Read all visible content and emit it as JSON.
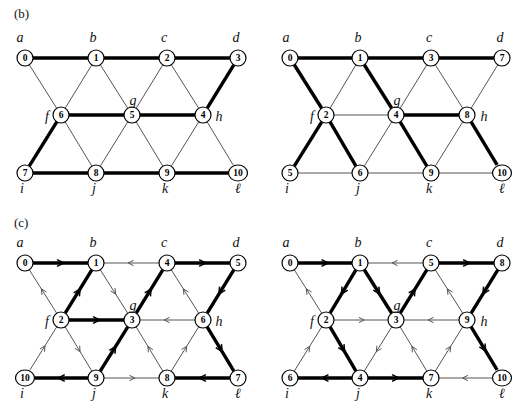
{
  "figure": {
    "title_parts": [
      "(b)",
      "(c)"
    ],
    "corner_letters": [
      "a",
      "b",
      "c",
      "d",
      "f",
      "g",
      "h",
      "i",
      "j",
      "k",
      "ℓ"
    ],
    "background": "#ffffff",
    "thick_color": "#000000",
    "thin_color": "#555555",
    "node_fill": "#ffffff"
  },
  "panels": [
    {
      "id": "b-left",
      "tag": "(b)",
      "tag_pos": [
        14,
        18
      ],
      "origin": [
        25,
        58
      ],
      "show_tag": true,
      "directed": false,
      "node_labels": [
        "0",
        "1",
        "2",
        "3",
        "4",
        "5",
        "6",
        "7",
        "8",
        "9",
        "10"
      ],
      "nodes": [
        {
          "label": "0",
          "x": 25,
          "y": 58
        },
        {
          "label": "1",
          "x": 96,
          "y": 58
        },
        {
          "label": "2",
          "x": 167,
          "y": 58
        },
        {
          "label": "3",
          "x": 238,
          "y": 58
        },
        {
          "label": "6",
          "x": 61,
          "y": 115
        },
        {
          "label": "5",
          "x": 132,
          "y": 115
        },
        {
          "label": "4",
          "x": 203,
          "y": 115
        },
        {
          "label": "7",
          "x": 25,
          "y": 173
        },
        {
          "label": "8",
          "x": 96,
          "y": 173
        },
        {
          "label": "9",
          "x": 167,
          "y": 173
        },
        {
          "label": "10",
          "x": 238,
          "y": 173
        }
      ],
      "corner_labels": [
        {
          "text": "a",
          "x": 20,
          "y": 42,
          "anchor": "middle"
        },
        {
          "text": "b",
          "x": 93,
          "y": 42,
          "anchor": "middle"
        },
        {
          "text": "c",
          "x": 164,
          "y": 42,
          "anchor": "middle"
        },
        {
          "text": "d",
          "x": 236,
          "y": 42,
          "anchor": "middle"
        },
        {
          "text": "f",
          "x": 47,
          "y": 121,
          "anchor": "middle"
        },
        {
          "text": "g",
          "x": 133,
          "y": 105,
          "anchor": "middle"
        },
        {
          "text": "h",
          "x": 219,
          "y": 121,
          "anchor": "middle"
        },
        {
          "text": "i",
          "x": 22,
          "y": 193,
          "anchor": "middle"
        },
        {
          "text": "j",
          "x": 94,
          "y": 193,
          "anchor": "middle"
        },
        {
          "text": "k",
          "x": 165,
          "y": 193,
          "anchor": "middle"
        },
        {
          "text": "ℓ",
          "x": 238,
          "y": 193,
          "anchor": "middle"
        }
      ],
      "edges": [
        {
          "from": "0",
          "to": "1",
          "weight": "thick"
        },
        {
          "from": "1",
          "to": "2",
          "weight": "thick"
        },
        {
          "from": "2",
          "to": "3",
          "weight": "thick"
        },
        {
          "from": "0",
          "to": "6",
          "weight": "thin"
        },
        {
          "from": "1",
          "to": "6",
          "weight": "thin"
        },
        {
          "from": "1",
          "to": "5",
          "weight": "thin"
        },
        {
          "from": "2",
          "to": "5",
          "weight": "thin"
        },
        {
          "from": "2",
          "to": "4",
          "weight": "thin"
        },
        {
          "from": "3",
          "to": "4",
          "weight": "thick"
        },
        {
          "from": "6",
          "to": "5",
          "weight": "thick"
        },
        {
          "from": "5",
          "to": "4",
          "weight": "thick"
        },
        {
          "from": "6",
          "to": "7",
          "weight": "thick"
        },
        {
          "from": "6",
          "to": "8",
          "weight": "thin"
        },
        {
          "from": "5",
          "to": "8",
          "weight": "thin"
        },
        {
          "from": "5",
          "to": "9",
          "weight": "thin"
        },
        {
          "from": "4",
          "to": "9",
          "weight": "thin"
        },
        {
          "from": "4",
          "to": "10",
          "weight": "thin"
        },
        {
          "from": "7",
          "to": "8",
          "weight": "thick"
        },
        {
          "from": "8",
          "to": "9",
          "weight": "thick"
        },
        {
          "from": "9",
          "to": "10",
          "weight": "thick"
        }
      ]
    },
    {
      "id": "b-right",
      "tag": "",
      "tag_pos": [
        0,
        0
      ],
      "show_tag": false,
      "directed": false,
      "node_labels": [
        "0",
        "1",
        "3",
        "7",
        "2",
        "4",
        "8",
        "5",
        "6",
        "9",
        "10"
      ],
      "nodes": [
        {
          "label": "0",
          "x": 290,
          "y": 58
        },
        {
          "label": "1",
          "x": 360,
          "y": 58
        },
        {
          "label": "3",
          "x": 431,
          "y": 58
        },
        {
          "label": "7",
          "x": 502,
          "y": 58
        },
        {
          "label": "2",
          "x": 326,
          "y": 115
        },
        {
          "label": "4",
          "x": 396,
          "y": 115
        },
        {
          "label": "8",
          "x": 467,
          "y": 115
        },
        {
          "label": "5",
          "x": 290,
          "y": 173
        },
        {
          "label": "6",
          "x": 360,
          "y": 173
        },
        {
          "label": "9",
          "x": 431,
          "y": 173
        },
        {
          "label": "10",
          "x": 502,
          "y": 173
        }
      ],
      "corner_labels": [
        {
          "text": "a",
          "x": 286,
          "y": 42,
          "anchor": "middle"
        },
        {
          "text": "b",
          "x": 358,
          "y": 42,
          "anchor": "middle"
        },
        {
          "text": "c",
          "x": 429,
          "y": 42,
          "anchor": "middle"
        },
        {
          "text": "d",
          "x": 500,
          "y": 42,
          "anchor": "middle"
        },
        {
          "text": "f",
          "x": 312,
          "y": 121,
          "anchor": "middle"
        },
        {
          "text": "g",
          "x": 397,
          "y": 105,
          "anchor": "middle"
        },
        {
          "text": "h",
          "x": 484,
          "y": 121,
          "anchor": "middle"
        },
        {
          "text": "i",
          "x": 287,
          "y": 193,
          "anchor": "middle"
        },
        {
          "text": "j",
          "x": 358,
          "y": 193,
          "anchor": "middle"
        },
        {
          "text": "k",
          "x": 429,
          "y": 193,
          "anchor": "middle"
        },
        {
          "text": "ℓ",
          "x": 502,
          "y": 193,
          "anchor": "middle"
        }
      ],
      "edges": [
        {
          "from": "0",
          "to": "1",
          "weight": "thick"
        },
        {
          "from": "1",
          "to": "3",
          "weight": "thick"
        },
        {
          "from": "3",
          "to": "7",
          "weight": "thick"
        },
        {
          "from": "0",
          "to": "2",
          "weight": "thick"
        },
        {
          "from": "1",
          "to": "2",
          "weight": "thin"
        },
        {
          "from": "1",
          "to": "4",
          "weight": "thick"
        },
        {
          "from": "3",
          "to": "4",
          "weight": "thin"
        },
        {
          "from": "3",
          "to": "8",
          "weight": "thin"
        },
        {
          "from": "7",
          "to": "8",
          "weight": "thin"
        },
        {
          "from": "2",
          "to": "4",
          "weight": "thin"
        },
        {
          "from": "4",
          "to": "8",
          "weight": "thick"
        },
        {
          "from": "2",
          "to": "5",
          "weight": "thick"
        },
        {
          "from": "2",
          "to": "6",
          "weight": "thick"
        },
        {
          "from": "4",
          "to": "6",
          "weight": "thin"
        },
        {
          "from": "4",
          "to": "9",
          "weight": "thick"
        },
        {
          "from": "8",
          "to": "9",
          "weight": "thin"
        },
        {
          "from": "8",
          "to": "10",
          "weight": "thick"
        },
        {
          "from": "5",
          "to": "6",
          "weight": "thin"
        },
        {
          "from": "6",
          "to": "9",
          "weight": "thin"
        },
        {
          "from": "9",
          "to": "10",
          "weight": "thin"
        }
      ]
    },
    {
      "id": "c-left",
      "tag": "(c)",
      "tag_pos": [
        14,
        227
      ],
      "show_tag": true,
      "directed": true,
      "node_labels": [
        "0",
        "1",
        "4",
        "5",
        "2",
        "3",
        "6",
        "10",
        "9",
        "8",
        "7"
      ],
      "nodes": [
        {
          "label": "0",
          "x": 25,
          "y": 263
        },
        {
          "label": "1",
          "x": 96,
          "y": 263
        },
        {
          "label": "4",
          "x": 167,
          "y": 263
        },
        {
          "label": "5",
          "x": 238,
          "y": 263
        },
        {
          "label": "2",
          "x": 61,
          "y": 320
        },
        {
          "label": "3",
          "x": 132,
          "y": 320
        },
        {
          "label": "6",
          "x": 203,
          "y": 320
        },
        {
          "label": "10",
          "x": 25,
          "y": 378
        },
        {
          "label": "9",
          "x": 96,
          "y": 378
        },
        {
          "label": "8",
          "x": 167,
          "y": 378
        },
        {
          "label": "7",
          "x": 238,
          "y": 378
        }
      ],
      "corner_labels": [
        {
          "text": "a",
          "x": 20,
          "y": 247,
          "anchor": "middle"
        },
        {
          "text": "b",
          "x": 93,
          "y": 247,
          "anchor": "middle"
        },
        {
          "text": "c",
          "x": 164,
          "y": 247,
          "anchor": "middle"
        },
        {
          "text": "d",
          "x": 236,
          "y": 247,
          "anchor": "middle"
        },
        {
          "text": "f",
          "x": 47,
          "y": 326,
          "anchor": "middle"
        },
        {
          "text": "g",
          "x": 133,
          "y": 310,
          "anchor": "middle"
        },
        {
          "text": "h",
          "x": 219,
          "y": 326,
          "anchor": "middle"
        },
        {
          "text": "i",
          "x": 22,
          "y": 398,
          "anchor": "middle"
        },
        {
          "text": "j",
          "x": 94,
          "y": 398,
          "anchor": "middle"
        },
        {
          "text": "k",
          "x": 165,
          "y": 398,
          "anchor": "middle"
        },
        {
          "text": "ℓ",
          "x": 238,
          "y": 398,
          "anchor": "middle"
        }
      ],
      "edges": [
        {
          "from": "0",
          "to": "1",
          "weight": "thick",
          "arrow": true
        },
        {
          "from": "4",
          "to": "1",
          "weight": "thin",
          "arrow": true
        },
        {
          "from": "4",
          "to": "5",
          "weight": "thick",
          "arrow": true
        },
        {
          "from": "2",
          "to": "0",
          "weight": "thin",
          "arrow": true
        },
        {
          "from": "2",
          "to": "1",
          "weight": "thick",
          "arrow": true
        },
        {
          "from": "1",
          "to": "3",
          "weight": "thin",
          "arrow": true
        },
        {
          "from": "3",
          "to": "4",
          "weight": "thick",
          "arrow": true
        },
        {
          "from": "6",
          "to": "4",
          "weight": "thin",
          "arrow": true
        },
        {
          "from": "5",
          "to": "6",
          "weight": "thick",
          "arrow": true
        },
        {
          "from": "2",
          "to": "3",
          "weight": "thick",
          "arrow": true
        },
        {
          "from": "6",
          "to": "3",
          "weight": "thin",
          "arrow": true
        },
        {
          "from": "10",
          "to": "2",
          "weight": "thin",
          "arrow": true
        },
        {
          "from": "2",
          "to": "9",
          "weight": "thin",
          "arrow": true
        },
        {
          "from": "9",
          "to": "3",
          "weight": "thick",
          "arrow": true
        },
        {
          "from": "8",
          "to": "3",
          "weight": "thin",
          "arrow": true
        },
        {
          "from": "8",
          "to": "6",
          "weight": "thin",
          "arrow": true
        },
        {
          "from": "6",
          "to": "7",
          "weight": "thick",
          "arrow": true
        },
        {
          "from": "9",
          "to": "10",
          "weight": "thick",
          "arrow": true
        },
        {
          "from": "9",
          "to": "8",
          "weight": "thin",
          "arrow": true
        },
        {
          "from": "7",
          "to": "8",
          "weight": "thick",
          "arrow": true
        }
      ]
    },
    {
      "id": "c-right",
      "tag": "",
      "tag_pos": [
        0,
        0
      ],
      "show_tag": false,
      "directed": true,
      "node_labels": [
        "0",
        "1",
        "5",
        "8",
        "2",
        "3",
        "9",
        "6",
        "4",
        "7",
        "10"
      ],
      "nodes": [
        {
          "label": "0",
          "x": 290,
          "y": 263
        },
        {
          "label": "1",
          "x": 360,
          "y": 263
        },
        {
          "label": "5",
          "x": 431,
          "y": 263
        },
        {
          "label": "8",
          "x": 502,
          "y": 263
        },
        {
          "label": "2",
          "x": 326,
          "y": 320
        },
        {
          "label": "3",
          "x": 396,
          "y": 320
        },
        {
          "label": "9",
          "x": 467,
          "y": 320
        },
        {
          "label": "6",
          "x": 290,
          "y": 378
        },
        {
          "label": "4",
          "x": 360,
          "y": 378
        },
        {
          "label": "7",
          "x": 431,
          "y": 378
        },
        {
          "label": "10",
          "x": 502,
          "y": 378
        }
      ],
      "corner_labels": [
        {
          "text": "a",
          "x": 286,
          "y": 247,
          "anchor": "middle"
        },
        {
          "text": "b",
          "x": 358,
          "y": 247,
          "anchor": "middle"
        },
        {
          "text": "c",
          "x": 429,
          "y": 247,
          "anchor": "middle"
        },
        {
          "text": "d",
          "x": 500,
          "y": 247,
          "anchor": "middle"
        },
        {
          "text": "f",
          "x": 312,
          "y": 326,
          "anchor": "middle"
        },
        {
          "text": "g",
          "x": 397,
          "y": 310,
          "anchor": "middle"
        },
        {
          "text": "h",
          "x": 484,
          "y": 326,
          "anchor": "middle"
        },
        {
          "text": "i",
          "x": 287,
          "y": 398,
          "anchor": "middle"
        },
        {
          "text": "j",
          "x": 358,
          "y": 398,
          "anchor": "middle"
        },
        {
          "text": "k",
          "x": 429,
          "y": 398,
          "anchor": "middle"
        },
        {
          "text": "ℓ",
          "x": 502,
          "y": 398,
          "anchor": "middle"
        }
      ],
      "edges": [
        {
          "from": "0",
          "to": "1",
          "weight": "thick",
          "arrow": true
        },
        {
          "from": "5",
          "to": "1",
          "weight": "thin",
          "arrow": true
        },
        {
          "from": "5",
          "to": "8",
          "weight": "thick",
          "arrow": true
        },
        {
          "from": "2",
          "to": "0",
          "weight": "thin",
          "arrow": true
        },
        {
          "from": "1",
          "to": "2",
          "weight": "thick",
          "arrow": true
        },
        {
          "from": "1",
          "to": "3",
          "weight": "thick",
          "arrow": true
        },
        {
          "from": "3",
          "to": "5",
          "weight": "thick",
          "arrow": true
        },
        {
          "from": "9",
          "to": "5",
          "weight": "thin",
          "arrow": true
        },
        {
          "from": "8",
          "to": "9",
          "weight": "thick",
          "arrow": true
        },
        {
          "from": "2",
          "to": "3",
          "weight": "thin",
          "arrow": true
        },
        {
          "from": "9",
          "to": "3",
          "weight": "thin",
          "arrow": true
        },
        {
          "from": "6",
          "to": "2",
          "weight": "thin",
          "arrow": true
        },
        {
          "from": "2",
          "to": "4",
          "weight": "thick",
          "arrow": true
        },
        {
          "from": "3",
          "to": "4",
          "weight": "thin",
          "arrow": true
        },
        {
          "from": "7",
          "to": "3",
          "weight": "thin",
          "arrow": true
        },
        {
          "from": "7",
          "to": "9",
          "weight": "thin",
          "arrow": true
        },
        {
          "from": "9",
          "to": "10",
          "weight": "thick",
          "arrow": true
        },
        {
          "from": "4",
          "to": "6",
          "weight": "thick",
          "arrow": true
        },
        {
          "from": "4",
          "to": "7",
          "weight": "thick",
          "arrow": true
        },
        {
          "from": "10",
          "to": "7",
          "weight": "thin",
          "arrow": true
        }
      ]
    }
  ]
}
